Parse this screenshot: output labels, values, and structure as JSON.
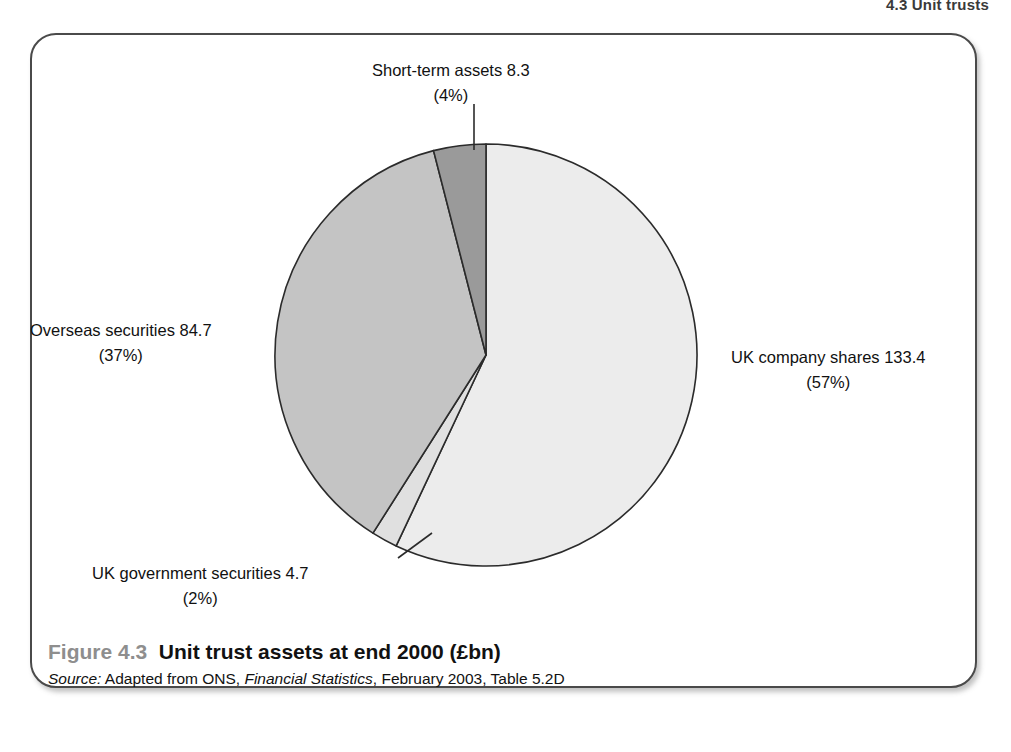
{
  "page_header": "4.3 Unit trusts",
  "caption": {
    "figure_number": "Figure 4.3",
    "title": "Unit trust assets at end 2000 (£bn)",
    "source_prefix": "Source:",
    "source_body_1": " Adapted from ONS, ",
    "source_publication": "Financial Statistics",
    "source_body_2": ", February 2003, Table 5.2D"
  },
  "labels": {
    "short_term": {
      "name": "Short-term assets 8.3",
      "pct": "(4%)"
    },
    "overseas": {
      "name": "Overseas securities 84.7",
      "pct": "(37%)"
    },
    "uk_shares": {
      "name": "UK company shares 133.4",
      "pct": "(57%)"
    },
    "uk_gov": {
      "name": "UK government securities 4.7",
      "pct": "(2%)"
    }
  },
  "chart_data": {
    "type": "pie",
    "title": "Unit trust assets at end 2000 (£bn)",
    "unit": "£bn",
    "total": 231.1,
    "legend": "none (direct callout labels)",
    "start_angle_deg": 0,
    "direction": "clockwise",
    "categories": [
      "UK company shares",
      "UK government securities",
      "Overseas securities",
      "Short-term assets"
    ],
    "values": [
      133.4,
      4.7,
      84.7,
      8.3
    ],
    "percents": [
      57,
      2,
      37,
      4
    ],
    "slices": [
      {
        "label": "UK company shares",
        "value": 133.4,
        "percent": 57,
        "color": "#ececec"
      },
      {
        "label": "UK government securities",
        "value": 4.7,
        "percent": 2,
        "color": "#e0e0e0"
      },
      {
        "label": "Overseas securities",
        "value": 84.7,
        "percent": 37,
        "color": "#c4c4c4"
      },
      {
        "label": "Short-term assets",
        "value": 8.3,
        "percent": 4,
        "color": "#9a9a9a"
      }
    ],
    "stroke_color": "#2b2b2b"
  }
}
